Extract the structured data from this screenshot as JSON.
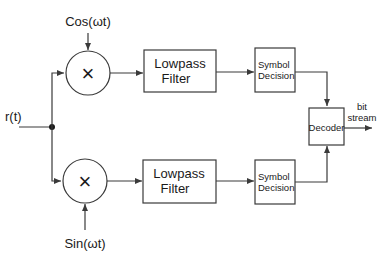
{
  "diagram": {
    "input_label": "r(t)",
    "top_branch": {
      "carrier_label": "Cos(ωt)",
      "mixer_symbol": "×",
      "filter_line1": "Lowpass",
      "filter_line2": "Filter",
      "decision_line1": "Symbol",
      "decision_line2": "Decision"
    },
    "bottom_branch": {
      "carrier_label": "Sin(ωt)",
      "mixer_symbol": "×",
      "filter_line1": "Lowpass",
      "filter_line2": "Filter",
      "decision_line1": "Symbol",
      "decision_line2": "Decision"
    },
    "decoder_label": "Decoder",
    "output_line1": "bit",
    "output_line2": "stream",
    "colors": {
      "stroke": "#3a3a3a",
      "text": "#1a1a1a",
      "background": "#ffffff"
    }
  }
}
